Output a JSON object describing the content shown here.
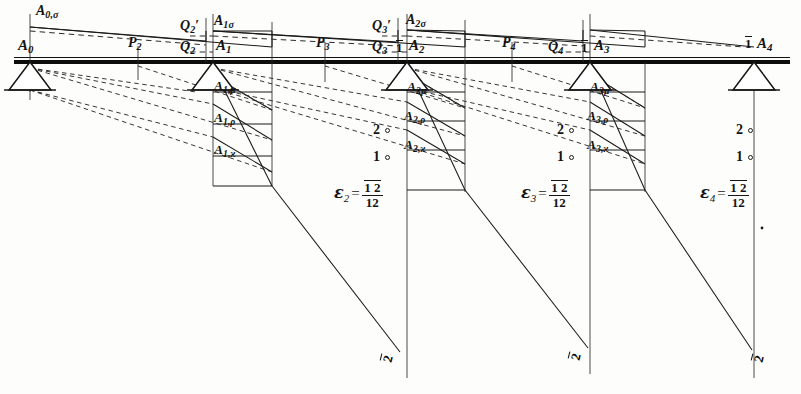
{
  "figure": {
    "width": 801,
    "height": 394,
    "ink_color": "#141414",
    "paper_color": "#fdfdfb"
  },
  "supports": [
    {
      "id": "A0",
      "label": "A",
      "sub": "0",
      "x": 30,
      "y": 62
    },
    {
      "id": "A1",
      "label": "A",
      "sub": "1",
      "x": 213,
      "y": 62
    },
    {
      "id": "A2",
      "label": "A",
      "sub": "2",
      "x": 407,
      "y": 62
    },
    {
      "id": "A3",
      "label": "A",
      "sub": "3",
      "x": 590,
      "y": 62
    },
    {
      "id": "A4",
      "label": "A",
      "sub": "4",
      "x": 754,
      "y": 62
    }
  ],
  "node_labels": [
    {
      "name": "A0-label",
      "base": "A",
      "sub": "0",
      "x": 18,
      "y": 44
    },
    {
      "name": "A1-label",
      "base": "A",
      "sub": "1",
      "x": 216,
      "y": 44
    },
    {
      "name": "A2-label",
      "base": "A",
      "sub": "2",
      "x": 409,
      "y": 44
    },
    {
      "name": "A3-label",
      "base": "A",
      "sub": "3",
      "x": 594,
      "y": 44
    },
    {
      "name": "A4-label",
      "base": "A",
      "sub": "4",
      "x": 757,
      "y": 44
    }
  ],
  "bar_one_marks": [
    {
      "name": "bar-one-at-A2",
      "text": "1",
      "x": 396,
      "y": 44
    },
    {
      "name": "bar-one-at-A3",
      "text": "1",
      "x": 580,
      "y": 44
    },
    {
      "name": "bar-one-at-A4",
      "text": "1",
      "x": 744,
      "y": 42
    }
  ],
  "sigma_labels": [
    {
      "name": "A0-sigma-label",
      "base": "A",
      "sub": "0,σ",
      "x": 36,
      "y": 6
    },
    {
      "name": "A1-sigma-label",
      "base": "A",
      "sub": "1σ",
      "x": 213,
      "y": 18
    },
    {
      "name": "A2-sigma-label",
      "base": "A",
      "sub": "2σ",
      "x": 406,
      "y": 17
    }
  ],
  "load_point_labels": [
    {
      "name": "P2-label",
      "base": "P",
      "sub": "2",
      "x": 131,
      "y": 40
    },
    {
      "name": "P3-label",
      "base": "P",
      "sub": "3",
      "x": 318,
      "y": 40
    },
    {
      "name": "P4-label",
      "base": "P",
      "sub": "4",
      "x": 504,
      "y": 40
    }
  ],
  "shear_labels": [
    {
      "name": "Q2-prime-label",
      "base": "Q",
      "sub": "2",
      "prime": true,
      "x": 184,
      "y": 23
    },
    {
      "name": "Q2-label",
      "base": "Q",
      "sub": "2",
      "prime": false,
      "x": 184,
      "y": 44
    },
    {
      "name": "Q3-prime-label",
      "base": "Q",
      "sub": "3",
      "prime": true,
      "x": 375,
      "y": 23
    },
    {
      "name": "Q3-label",
      "base": "Q",
      "sub": "3",
      "prime": false,
      "x": 375,
      "y": 44
    },
    {
      "name": "Q4-label",
      "base": "Q",
      "sub": "4",
      "prime": false,
      "x": 549,
      "y": 44
    }
  ],
  "area_labels": [
    {
      "name": "A1-mu-label",
      "base": "A",
      "sub": "1,μ",
      "x": 212,
      "y": 83
    },
    {
      "name": "A1-rho-label",
      "base": "A",
      "sub": "1,ρ",
      "x": 212,
      "y": 116
    },
    {
      "name": "A1-kappa-label",
      "base": "A",
      "sub": "1,ϰ",
      "x": 212,
      "y": 148
    },
    {
      "name": "A2-mu-label",
      "base": "A",
      "sub": "2μ",
      "x": 406,
      "y": 85
    },
    {
      "name": "A2-rho-label",
      "base": "A",
      "sub": "2,ρ",
      "x": 403,
      "y": 114
    },
    {
      "name": "A2-kappa-label",
      "base": "A",
      "sub": "2,ϰ",
      "x": 403,
      "y": 143
    },
    {
      "name": "A3-mu-label",
      "base": "A",
      "sub": "3μ",
      "x": 589,
      "y": 85
    },
    {
      "name": "A3-rho-label",
      "base": "A",
      "sub": "3,ρ",
      "x": 586,
      "y": 114
    },
    {
      "name": "A3-kappa-label",
      "base": "A",
      "sub": "3,ϰ",
      "x": 586,
      "y": 143
    }
  ],
  "ordinate_marks": [
    {
      "name": "mark-2-span2",
      "text": "2",
      "x": 373,
      "y": 126,
      "cx": 390,
      "cy": 132
    },
    {
      "name": "mark-1-span2",
      "text": "1",
      "x": 373,
      "y": 152,
      "cx": 390,
      "cy": 158
    },
    {
      "name": "mark-2-span3",
      "text": "2",
      "x": 557,
      "y": 126,
      "cx": 574,
      "cy": 132
    },
    {
      "name": "mark-1-span3",
      "text": "1",
      "x": 557,
      "y": 152,
      "cx": 574,
      "cy": 158
    },
    {
      "name": "mark-2-span4",
      "text": "2",
      "x": 738,
      "y": 126,
      "cx": 755,
      "cy": 132
    },
    {
      "name": "mark-1-span4",
      "text": "1",
      "x": 738,
      "y": 152,
      "cx": 755,
      "cy": 158
    }
  ],
  "epsilon_formulas": [
    {
      "name": "epsilon-2-formula",
      "symbol": "ε",
      "sub": "2",
      "eq": "=",
      "numerator": "1 2",
      "denominator": "12",
      "numerator_overline": true,
      "denominator_overline": false,
      "x": 334,
      "y": 182
    },
    {
      "name": "epsilon-3-formula",
      "symbol": "ε",
      "sub": "3",
      "eq": "=",
      "numerator": "1 2",
      "denominator": "12",
      "numerator_overline": true,
      "denominator_overline": true,
      "x": 521,
      "y": 182
    },
    {
      "name": "epsilon-4-formula",
      "symbol": "ε",
      "sub": "4",
      "eq": "=",
      "numerator": "1 2",
      "denominator": "12",
      "numerator_overline": true,
      "denominator_overline": false,
      "x": 700,
      "y": 182
    }
  ],
  "bottom_two_marks": [
    {
      "name": "bottom-bar-two-span2",
      "text": "2",
      "x": 387,
      "y": 355
    },
    {
      "name": "bottom-bar-two-span3",
      "text": "2",
      "x": 575,
      "y": 353
    },
    {
      "name": "bottom-bar-two-span4",
      "text": "2",
      "x": 758,
      "y": 355
    }
  ],
  "geometry": {
    "baseline_y": 62,
    "baseline_x_start": 14,
    "baseline_x_end": 790,
    "verticals": [
      {
        "name": "vline-A0",
        "x": 30,
        "y1": 14,
        "y2": 88
      },
      {
        "name": "vline-P2",
        "x": 138,
        "y1": 46,
        "y2": 78
      },
      {
        "name": "vline-Q2",
        "x": 206,
        "y1": 18,
        "y2": 62
      },
      {
        "name": "vline-A1",
        "x": 213,
        "y1": 14,
        "y2": 185
      },
      {
        "name": "vline-end1",
        "x": 272,
        "y1": 22,
        "y2": 185
      },
      {
        "name": "vline-P3",
        "x": 325,
        "y1": 44,
        "y2": 80
      },
      {
        "name": "vline-A2",
        "x": 407,
        "y1": 14,
        "y2": 378
      },
      {
        "name": "vline-end2",
        "x": 465,
        "y1": 20,
        "y2": 190
      },
      {
        "name": "vline-P4",
        "x": 512,
        "y1": 44,
        "y2": 80
      },
      {
        "name": "vline-A3",
        "x": 590,
        "y1": 14,
        "y2": 374
      },
      {
        "name": "vline-end3",
        "x": 645,
        "y1": 62,
        "y2": 190
      },
      {
        "name": "vline-A4",
        "x": 754,
        "y1": 62,
        "y2": 378
      }
    ]
  }
}
